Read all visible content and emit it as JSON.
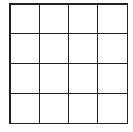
{
  "grid": {
    "rows": 4,
    "columns": 4,
    "line_color": "#222222",
    "background": "#ffffff",
    "cells": [
      [
        "",
        "",
        "",
        ""
      ],
      [
        "",
        "",
        "",
        ""
      ],
      [
        "",
        "",
        "",
        ""
      ],
      [
        "",
        "",
        "",
        ""
      ]
    ]
  }
}
